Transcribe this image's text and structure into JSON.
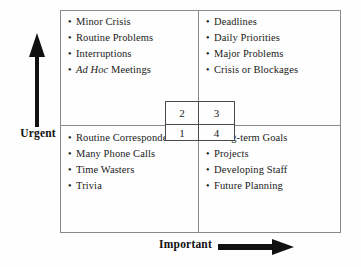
{
  "diagram": {
    "axes": {
      "vertical": {
        "label": "Urgent",
        "arrow_icon": "arrow-up-icon",
        "direction": "up"
      },
      "horizontal": {
        "label": "Important",
        "arrow_icon": "arrow-right-icon",
        "direction": "right"
      }
    },
    "bullet_glyph": "•",
    "quadrants": {
      "top_left": {
        "name": "urgent-not-important",
        "items": [
          {
            "text": "Minor Crisis",
            "italic_prefix": ""
          },
          {
            "text": "Routine Problems",
            "italic_prefix": ""
          },
          {
            "text": "Interruptions",
            "italic_prefix": ""
          },
          {
            "text": " Meetings",
            "italic_prefix": "Ad Hoc"
          }
        ]
      },
      "top_right": {
        "name": "urgent-and-important",
        "items": [
          {
            "text": "Deadlines",
            "italic_prefix": ""
          },
          {
            "text": "Daily Priorities",
            "italic_prefix": ""
          },
          {
            "text": "Major Problems",
            "italic_prefix": ""
          },
          {
            "text": "Crisis or Blockages",
            "italic_prefix": ""
          }
        ]
      },
      "bottom_left": {
        "name": "not-urgent-not-important",
        "items": [
          {
            "text": "Routine Correspondence",
            "italic_prefix": ""
          },
          {
            "text": "Many Phone Calls",
            "italic_prefix": ""
          },
          {
            "text": "Time Wasters",
            "italic_prefix": ""
          },
          {
            "text": "Trivia",
            "italic_prefix": ""
          }
        ]
      },
      "bottom_right": {
        "name": "not-urgent-but-important",
        "items": [
          {
            "text": "Long-term Goals",
            "italic_prefix": ""
          },
          {
            "text": "Projects",
            "italic_prefix": ""
          },
          {
            "text": "Developing Staff",
            "italic_prefix": ""
          },
          {
            "text": "Future Planning",
            "italic_prefix": ""
          }
        ]
      }
    },
    "center_box": {
      "name": "priority-order-key",
      "top_left": "2",
      "top_right": "3",
      "bottom_left": "1",
      "bottom_right": "4"
    },
    "colors": {
      "background": "#fefefe",
      "frame_line": "#8a8a8a",
      "center_box_line": "#4a4a4a",
      "text": "#1a1a1a",
      "arrow": "#111111"
    }
  }
}
